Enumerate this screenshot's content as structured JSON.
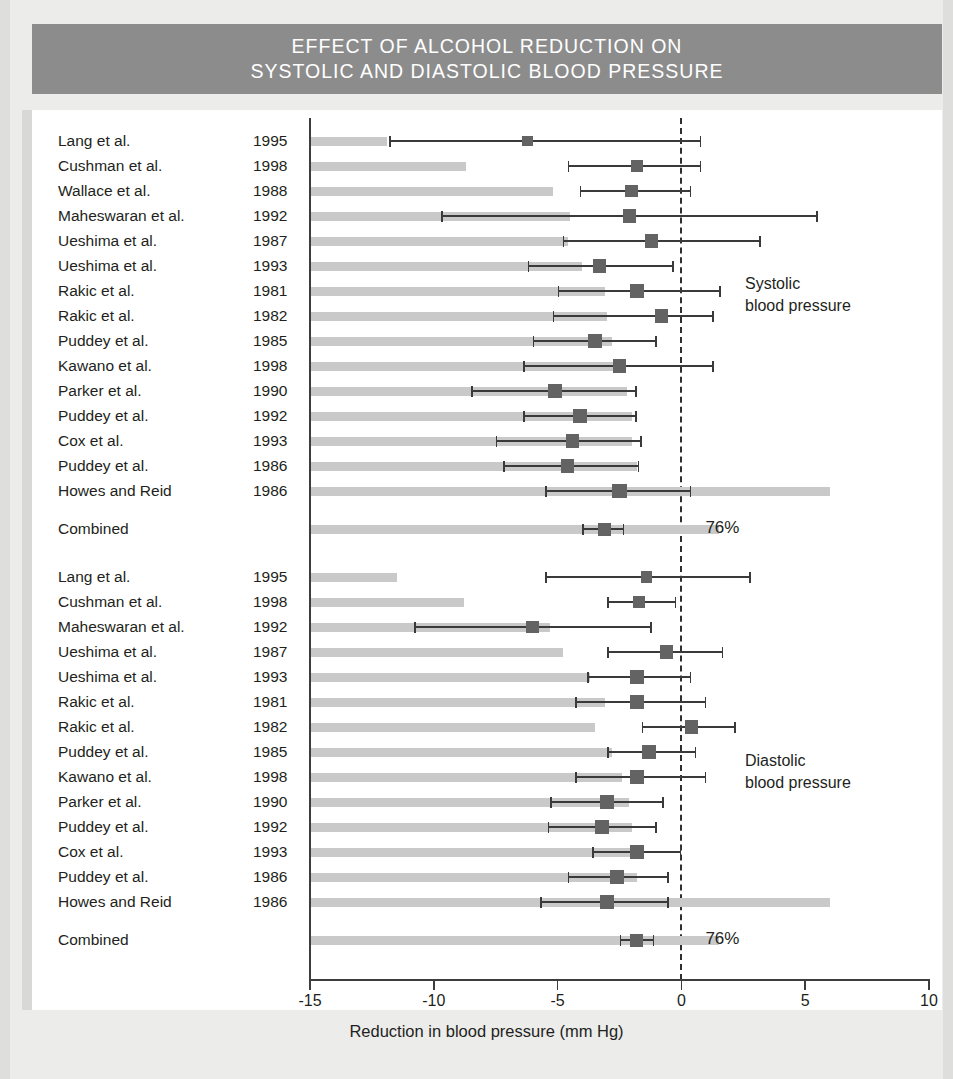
{
  "title": {
    "line1": "EFFECT OF ALCOHOL REDUCTION ON",
    "line2": "SYSTOLIC AND DIASTOLIC BLOOD PRESSURE"
  },
  "axis": {
    "xlabel": "Reduction in blood pressure (mm Hg)",
    "ticks": [
      "-15",
      "-10",
      "-5",
      "0",
      "5",
      "10"
    ]
  },
  "annotations": {
    "systolic_l1": "Systolic",
    "systolic_l2": "blood pressure",
    "diastolic_l1": "Diastolic",
    "diastolic_l2": "blood pressure",
    "systolic_pct": "76%",
    "diastolic_pct": "76%",
    "combined_label": "Combined"
  },
  "colors": {
    "banner": "#8c8c8c",
    "bar": "#c9c9c9",
    "marker": "#636363",
    "line": "#3a3a3a",
    "page": "#ececeb",
    "plot": "#ffffff"
  },
  "chart_data": {
    "type": "forest",
    "title": "EFFECT OF ALCOHOL REDUCTION ON SYSTOLIC AND DIASTOLIC BLOOD PRESSURE",
    "xlabel": "Reduction in blood pressure (mm Hg)",
    "ylabel": "",
    "xlim": [
      -15,
      10
    ],
    "xticks": [
      -15,
      -10,
      -5,
      0,
      5,
      10
    ],
    "grid": false,
    "reference_line": 0,
    "panels": [
      {
        "name": "Systolic blood pressure",
        "heterogeneity_pct": "76%",
        "rows": [
          {
            "study": "Lang et al.",
            "year": "1995",
            "effect": -6.2,
            "ci_low": -11.8,
            "ci_high": 0.8,
            "weight_bar": 3.1
          },
          {
            "study": "Cushman et al.",
            "year": "1998",
            "effect": -1.8,
            "ci_low": -4.6,
            "ci_high": 0.8,
            "weight_bar": 6.3
          },
          {
            "study": "Wallace et al.",
            "year": "1988",
            "effect": -2.0,
            "ci_low": -4.1,
            "ci_high": 0.4,
            "weight_bar": 9.8
          },
          {
            "study": "Maheswaran et al.",
            "year": "1992",
            "effect": -2.1,
            "ci_low": -9.7,
            "ci_high": 5.5,
            "weight_bar": 10.5
          },
          {
            "study": "Ueshima et al.",
            "year": "1987",
            "effect": -1.2,
            "ci_low": -4.8,
            "ci_high": 3.2,
            "weight_bar": 10.4
          },
          {
            "study": "Ueshima et al.",
            "year": "1993",
            "effect": -3.3,
            "ci_low": -6.2,
            "ci_high": -0.3,
            "weight_bar": 11.0
          },
          {
            "study": "Rakic et al.",
            "year": "1981",
            "effect": -1.8,
            "ci_low": -5.0,
            "ci_high": 1.6,
            "weight_bar": 11.9
          },
          {
            "study": "Rakic et al.",
            "year": "1982",
            "effect": -0.8,
            "ci_low": -5.2,
            "ci_high": 1.3,
            "weight_bar": 12.0
          },
          {
            "study": "Puddey et al.",
            "year": "1985",
            "effect": -3.5,
            "ci_low": -6.0,
            "ci_high": -1.0,
            "weight_bar": 12.2
          },
          {
            "study": "Kawano et al.",
            "year": "1998",
            "effect": -2.5,
            "ci_low": -6.4,
            "ci_high": 1.3,
            "weight_bar": 12.6
          },
          {
            "study": "Parker et al.",
            "year": "1990",
            "effect": -5.1,
            "ci_low": -8.5,
            "ci_high": -1.8,
            "weight_bar": 12.8
          },
          {
            "study": "Puddey et al.",
            "year": "1992",
            "effect": -4.1,
            "ci_low": -6.4,
            "ci_high": -1.8,
            "weight_bar": 13.0
          },
          {
            "study": "Cox et al.",
            "year": "1993",
            "effect": -4.4,
            "ci_low": -7.5,
            "ci_high": -1.6,
            "weight_bar": 13.0
          },
          {
            "study": "Puddey et al.",
            "year": "1986",
            "effect": -4.6,
            "ci_low": -7.2,
            "ci_high": -1.7,
            "weight_bar": 13.2
          },
          {
            "study": "Howes and Reid",
            "year": "1986",
            "effect": -2.5,
            "ci_low": -5.5,
            "ci_high": 0.4,
            "weight_bar": 21.0
          }
        ],
        "combined": {
          "study": "Combined",
          "year": "",
          "effect": -3.1,
          "ci_low": -4.0,
          "ci_high": -2.3,
          "weight_bar": 16.5
        }
      },
      {
        "name": "Diastolic blood pressure",
        "heterogeneity_pct": "76%",
        "rows": [
          {
            "study": "Lang et al.",
            "year": "1995",
            "effect": -1.4,
            "ci_low": -5.5,
            "ci_high": 2.8,
            "weight_bar": 3.5
          },
          {
            "study": "Cushman et al.",
            "year": "1998",
            "effect": -1.7,
            "ci_low": -3.0,
            "ci_high": -0.2,
            "weight_bar": 6.2
          },
          {
            "study": "Maheswaran et al.",
            "year": "1992",
            "effect": -6.0,
            "ci_low": -10.8,
            "ci_high": -1.2,
            "weight_bar": 9.7
          },
          {
            "study": "Ueshima et al.",
            "year": "1987",
            "effect": -0.6,
            "ci_low": -3.0,
            "ci_high": 1.7,
            "weight_bar": 10.2
          },
          {
            "study": "Ueshima et al.",
            "year": "1993",
            "effect": -1.8,
            "ci_low": -3.8,
            "ci_high": 0.4,
            "weight_bar": 11.3
          },
          {
            "study": "Rakic et al.",
            "year": "1981",
            "effect": -1.8,
            "ci_low": -4.3,
            "ci_high": 1.0,
            "weight_bar": 11.9
          },
          {
            "study": "Rakic et al.",
            "year": "1982",
            "effect": 0.4,
            "ci_low": -1.6,
            "ci_high": 2.2,
            "weight_bar": 11.5
          },
          {
            "study": "Puddey et al.",
            "year": "1985",
            "effect": -1.3,
            "ci_low": -3.0,
            "ci_high": 0.6,
            "weight_bar": 12.2
          },
          {
            "study": "Kawano et al.",
            "year": "1998",
            "effect": -1.8,
            "ci_low": -4.3,
            "ci_high": 1.0,
            "weight_bar": 12.6
          },
          {
            "study": "Parker et al.",
            "year": "1990",
            "effect": -3.0,
            "ci_low": -5.3,
            "ci_high": -0.7,
            "weight_bar": 12.9
          },
          {
            "study": "Puddey et al.",
            "year": "1992",
            "effect": -3.2,
            "ci_low": -5.4,
            "ci_high": -1.0,
            "weight_bar": 13.0
          },
          {
            "study": "Cox et al.",
            "year": "1993",
            "effect": -1.8,
            "ci_low": -3.6,
            "ci_high": 0.0,
            "weight_bar": 13.0
          },
          {
            "study": "Puddey et al.",
            "year": "1986",
            "effect": -2.6,
            "ci_low": -4.6,
            "ci_high": -0.5,
            "weight_bar": 13.2
          },
          {
            "study": "Howes and Reid",
            "year": "1986",
            "effect": -3.0,
            "ci_low": -5.7,
            "ci_high": -0.5,
            "weight_bar": 21.0
          }
        ],
        "combined": {
          "study": "Combined",
          "year": "",
          "effect": -1.8,
          "ci_low": -2.5,
          "ci_high": -1.1,
          "weight_bar": 16.5
        }
      }
    ]
  }
}
